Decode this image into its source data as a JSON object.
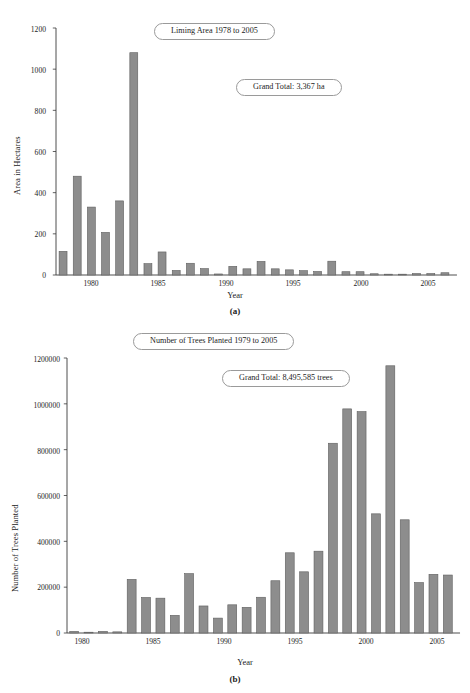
{
  "figure_a": {
    "panel_label": "(a)",
    "title_pill": "Liming Area 1978 to 2005",
    "total_pill": "Grand Total: 3,367 ha",
    "ylabel": "Area in Hectares",
    "xlabel": "Year",
    "yticks": [
      "0",
      "200",
      "400",
      "600",
      "800",
      "1000",
      "1200"
    ],
    "xticks": [
      "1980",
      "1985",
      "1990",
      "1995",
      "2000",
      "2005"
    ]
  },
  "figure_b": {
    "panel_label": "(b)",
    "title_pill": "Number of Trees Planted 1979 to 2005",
    "total_pill": "Grand Total: 8,495,585 trees",
    "ylabel": "Number of Trees Planted",
    "xlabel": "Year",
    "yticks": [
      "0",
      "200000",
      "400000",
      "600000",
      "800000",
      "1000000",
      "1200000"
    ],
    "xticks": [
      "1980",
      "1985",
      "1990",
      "1995",
      "2000",
      "2005"
    ]
  },
  "colors": {
    "bar_fill": "#8d8d8d",
    "bar_stroke": "#5f5f5f",
    "axis": "#3a3a3a",
    "text": "#1c1c1c",
    "background": "#ffffff"
  },
  "chart_data": [
    {
      "type": "bar",
      "title": "Liming Area 1978 to 2005",
      "annotation": "Grand Total: 3,367 ha",
      "xlabel": "Year",
      "ylabel": "Area in Hectares",
      "ylim": [
        0,
        1200
      ],
      "yticks": [
        0,
        200,
        400,
        600,
        800,
        1000,
        1200
      ],
      "grid": false,
      "legend": "none",
      "categories": [
        1978,
        1979,
        1980,
        1981,
        1982,
        1983,
        1984,
        1985,
        1986,
        1987,
        1988,
        1989,
        1990,
        1991,
        1992,
        1993,
        1994,
        1995,
        1996,
        1997,
        1998,
        1999,
        2000,
        2001,
        2002,
        2003,
        2004,
        2005
      ],
      "values": [
        115,
        480,
        330,
        207,
        360,
        1080,
        55,
        112,
        22,
        57,
        31,
        5,
        42,
        30,
        66,
        30,
        25,
        21,
        17,
        67,
        16,
        16,
        6,
        4,
        4,
        7,
        7,
        11
      ]
    },
    {
      "type": "bar",
      "title": "Number of Trees Planted 1979 to 2005",
      "annotation": "Grand Total: 8,495,585 trees",
      "xlabel": "Year",
      "ylabel": "Number of Trees Planted",
      "ylim": [
        0,
        1200000
      ],
      "yticks": [
        0,
        200000,
        400000,
        600000,
        800000,
        1000000,
        1200000
      ],
      "grid": false,
      "legend": "none",
      "categories": [
        1979,
        1980,
        1981,
        1982,
        1983,
        1984,
        1985,
        1986,
        1987,
        1988,
        1989,
        1990,
        1991,
        1992,
        1993,
        1994,
        1995,
        1996,
        1997,
        1998,
        1999,
        2000,
        2001,
        2002,
        2003,
        2004,
        2005
      ],
      "values": [
        7000,
        2000,
        7000,
        5000,
        234000,
        155000,
        152000,
        77000,
        259000,
        118000,
        65000,
        123000,
        112000,
        156000,
        228000,
        350000,
        267000,
        357000,
        828000,
        978000,
        966000,
        520000,
        1166000,
        494000,
        220000,
        256000,
        253000
      ]
    }
  ]
}
